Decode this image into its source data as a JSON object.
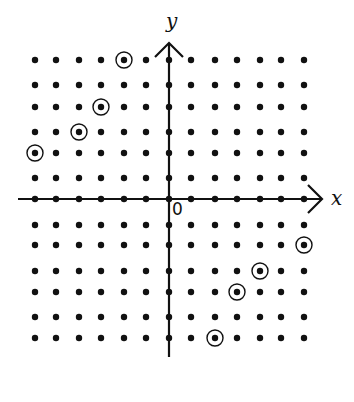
{
  "diagram": {
    "type": "integer lattice with coordinate axes",
    "x_axis_label": "x",
    "y_axis_label": "y",
    "origin_label": "0",
    "lattice": {
      "x_range": [
        -6,
        6
      ],
      "y_range": [
        -6,
        6
      ]
    },
    "circled_points": [
      {
        "x": -2,
        "y": 6
      },
      {
        "x": -3,
        "y": 4
      },
      {
        "x": -4,
        "y": 3
      },
      {
        "x": -6,
        "y": 2
      },
      {
        "x": 6,
        "y": -2
      },
      {
        "x": 4,
        "y": -3
      },
      {
        "x": 3,
        "y": -4
      },
      {
        "x": 2,
        "y": -6
      }
    ],
    "colors": {
      "ink": "#111111",
      "background": "#ffffff"
    }
  }
}
